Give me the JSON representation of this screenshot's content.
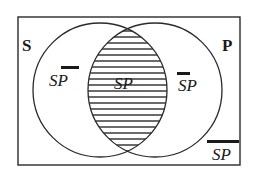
{
  "diagram": {
    "type": "venn",
    "universe": {
      "x": 18,
      "y": 17,
      "width": 222,
      "height": 148
    },
    "sets": [
      {
        "name": "S",
        "label": "S",
        "cx": 100,
        "cy": 90,
        "r": 67
      },
      {
        "name": "P",
        "label": "P",
        "cx": 155,
        "cy": 90,
        "r": 67
      }
    ],
    "shaded_region": "SP",
    "hatch_spacing": 6,
    "regions": [
      {
        "id": "s-not-p",
        "text": "SP",
        "overbar": "P",
        "description": "S and not P"
      },
      {
        "id": "s-and-p",
        "text": "SP",
        "overbar": "",
        "description": "S and P (shaded)"
      },
      {
        "id": "not-s-p",
        "text": "SP",
        "overbar": "S",
        "description": "not S and P"
      },
      {
        "id": "not-s-not-p",
        "text": "SP",
        "overbar": "SP",
        "description": "not S and not P"
      }
    ],
    "colors": {
      "line": "#2a2a2a",
      "background": "#ffffff"
    }
  }
}
